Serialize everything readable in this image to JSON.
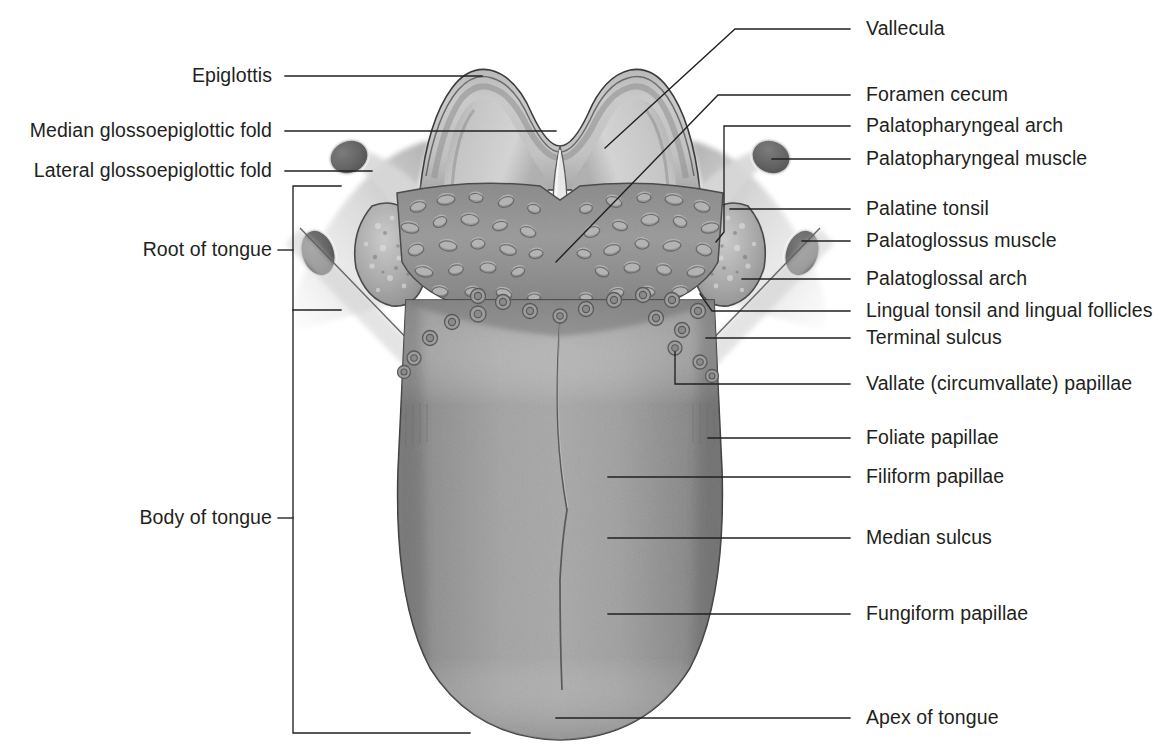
{
  "figure": {
    "type": "anatomical-illustration",
    "background_color": "#ffffff",
    "ink_color": "#231f20",
    "labels_left": [
      {
        "id": "epiglottis",
        "text": "Epiglottis",
        "x": 272,
        "y": 76
      },
      {
        "id": "median-glossoepiglottic-fold",
        "text": "Median glossoepiglottic fold",
        "x": 272,
        "y": 131
      },
      {
        "id": "lateral-glossoepiglottic-fold",
        "text": "Lateral glossoepiglottic fold",
        "x": 272,
        "y": 171
      },
      {
        "id": "root-of-tongue",
        "text": "Root of tongue",
        "x": 272,
        "y": 250
      },
      {
        "id": "body-of-tongue",
        "text": "Body of tongue",
        "x": 272,
        "y": 518
      }
    ],
    "labels_right": [
      {
        "id": "vallecula",
        "text": "Vallecula",
        "x": 866,
        "y": 29
      },
      {
        "id": "foramen-cecum",
        "text": "Foramen cecum",
        "x": 866,
        "y": 95
      },
      {
        "id": "palatopharyngeal-arch",
        "text": "Palatopharyngeal arch",
        "x": 866,
        "y": 126
      },
      {
        "id": "palatopharyngeal-muscle",
        "text": "Palatopharyngeal muscle",
        "x": 866,
        "y": 159
      },
      {
        "id": "palatine-tonsil",
        "text": "Palatine tonsil",
        "x": 866,
        "y": 209
      },
      {
        "id": "palatoglossus-muscle",
        "text": "Palatoglossus muscle",
        "x": 866,
        "y": 241
      },
      {
        "id": "palatoglossal-arch",
        "text": "Palatoglossal arch",
        "x": 866,
        "y": 279
      },
      {
        "id": "lingual-tonsil",
        "text": "Lingual tonsil and lingual follicles",
        "x": 866,
        "y": 311
      },
      {
        "id": "terminal-sulcus",
        "text": "Terminal sulcus",
        "x": 866,
        "y": 338
      },
      {
        "id": "vallate-papillae",
        "text": "Vallate (circumvallate) papillae",
        "x": 866,
        "y": 384
      },
      {
        "id": "foliate-papillae",
        "text": "Foliate papillae",
        "x": 866,
        "y": 438
      },
      {
        "id": "filiform-papillae",
        "text": "Filiform papillae",
        "x": 866,
        "y": 477
      },
      {
        "id": "median-sulcus",
        "text": "Median sulcus",
        "x": 866,
        "y": 538
      },
      {
        "id": "fungiform-papillae",
        "text": "Fungiform papillae",
        "x": 866,
        "y": 614
      },
      {
        "id": "apex-of-tongue",
        "text": "Apex of tongue",
        "x": 866,
        "y": 718
      }
    ],
    "colors": {
      "leader_line": "#231f20",
      "epiglottis_light": "#cfcfcf",
      "epiglottis_mid": "#b4b4b4",
      "lingual_tonsil": "#8d8d8d",
      "tongue_body": "#949494",
      "tonsil_fossa": "#b8b8b8",
      "dark_muscle": "#6e6e6e"
    }
  }
}
